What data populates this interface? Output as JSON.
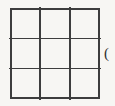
{
  "figure": {
    "type": "grid",
    "name": "3x3-square-grid",
    "rows": 3,
    "columns": 3,
    "cell_count": 9,
    "line_color": "#3d3d3d",
    "background_color": "#f7f6f3",
    "cells": [
      {
        "id": "r1c1",
        "row": 1,
        "col": 1,
        "label": ""
      },
      {
        "id": "r1c2",
        "row": 1,
        "col": 2,
        "label": ""
      },
      {
        "id": "r1c3",
        "row": 1,
        "col": 3,
        "label": ""
      },
      {
        "id": "r2c1",
        "row": 2,
        "col": 1,
        "label": ""
      },
      {
        "id": "r2c2",
        "row": 2,
        "col": 2,
        "label": ""
      },
      {
        "id": "r2c3",
        "row": 2,
        "col": 3,
        "label": ""
      },
      {
        "id": "r3c1",
        "row": 3,
        "col": 1,
        "label": ""
      },
      {
        "id": "r3c2",
        "row": 3,
        "col": 2,
        "label": ""
      },
      {
        "id": "r3c3",
        "row": 3,
        "col": 3,
        "label": ""
      }
    ]
  },
  "side_annotation": {
    "text": "(",
    "clipped": true
  }
}
